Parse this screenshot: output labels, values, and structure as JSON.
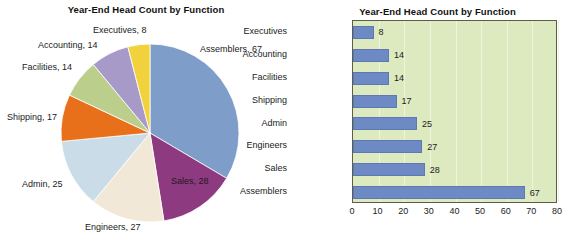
{
  "chart_data": [
    {
      "type": "pie",
      "title": "Year-End Head Count by Function",
      "categories": [
        "Assemblers",
        "Sales",
        "Engineers",
        "Admin",
        "Shipping",
        "Facilities",
        "Accounting",
        "Executives"
      ],
      "values": [
        67,
        28,
        27,
        25,
        17,
        14,
        14,
        8
      ],
      "labels": [
        "Assemblers, 67",
        "Sales, 28",
        "Engineers, 27",
        "Admin, 25",
        "Shipping, 17",
        "Facilities, 14",
        "Accounting, 14",
        "Executives, 8"
      ],
      "colors": [
        "#7e9dc9",
        "#8e3a80",
        "#f2e8d8",
        "#c9dce8",
        "#e8701a",
        "#bcce8c",
        "#a79ac9",
        "#f2d23c"
      ],
      "total": 200,
      "legend": "none",
      "labels_position": "outside-callout"
    },
    {
      "type": "bar",
      "orientation": "horizontal",
      "title": "Year-End Head Count by Function",
      "categories": [
        "Executives",
        "Accounting",
        "Facilities",
        "Shipping",
        "Admin",
        "Engineers",
        "Sales",
        "Assemblers"
      ],
      "values": [
        8,
        14,
        14,
        17,
        25,
        27,
        28,
        67
      ],
      "value_labels": [
        "8",
        "14",
        "14",
        "17",
        "25",
        "27",
        "28",
        "67"
      ],
      "xlabel": "",
      "ylabel": "",
      "xlim": [
        0,
        80
      ],
      "xticks": [
        "0",
        "10",
        "20",
        "30",
        "40",
        "50",
        "60",
        "70",
        "80"
      ],
      "xtick_values": [
        0,
        10,
        20,
        30,
        40,
        50,
        60,
        70,
        80
      ],
      "grid": "vertical",
      "bar_color": "#6d8ac4",
      "plot_background": "#dde9bf",
      "legend": "none"
    }
  ],
  "pie_panel": {
    "title": "Year-End Head Count by Function"
  },
  "bar_panel": {
    "title": "Year-End Head Count by Function"
  }
}
